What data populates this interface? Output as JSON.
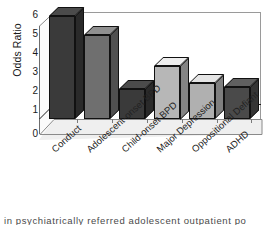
{
  "chart_data": {
    "type": "bar",
    "title": "",
    "xlabel": "",
    "ylabel": "Odds Ratio",
    "ylim": [
      0,
      6
    ],
    "yticks": [
      0,
      1,
      2,
      3,
      4,
      5,
      6
    ],
    "ytick_labels": [
      "0",
      "1",
      "2",
      "3",
      "4",
      "5",
      "6"
    ],
    "grid": false,
    "legend": "none",
    "reference_line": 1,
    "style": "3d-column",
    "categories": [
      "Conduct",
      "Adolescent-onset BPD",
      "Child-onset BPD",
      "Major Depression",
      "Oppositional Defiant",
      "ADHD"
    ],
    "values": [
      5.8,
      4.7,
      1.7,
      3.0,
      2.0,
      1.8
    ],
    "bar_colors": [
      "#3a3a3a",
      "#6f6f6f",
      "#3a3a3a",
      "#b7b7b7",
      "#b0b0b0",
      "#4a4a4a"
    ]
  },
  "axis": {
    "y_title": "Odds Ratio",
    "tick_labels": [
      "6",
      "5",
      "4",
      "3",
      "2",
      "1",
      "0"
    ]
  },
  "caption": {
    "text": "in psychiatrically referred adolescent outpatient po"
  },
  "colors": {
    "dark_bar": "#3a3a3a",
    "light_bar": "#b7b7b7",
    "axis": "#6e6e6e",
    "floor": "#efefef",
    "text": "#1a1a1a"
  }
}
